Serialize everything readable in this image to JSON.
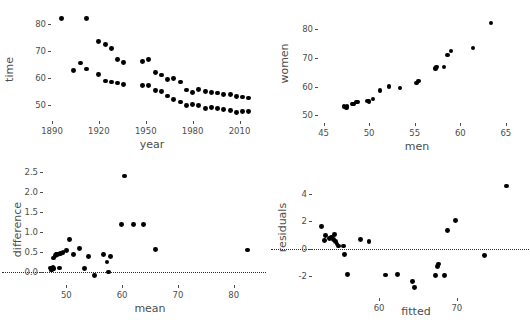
{
  "figure": {
    "background": "#ffffff",
    "point_color": "#000000",
    "text_color": "#4d4d4d",
    "reference_line_color": "#2b2b2b",
    "layout": "2x2 grid of scatter plots"
  },
  "chart_data": [
    {
      "id": "time-vs-year",
      "position": "top-left",
      "type": "scatter",
      "title": "",
      "xlabel": "year",
      "ylabel": "time",
      "xlim": [
        1890,
        2018
      ],
      "ylim": [
        46,
        86
      ],
      "xticks": [
        1890,
        1920,
        1950,
        1980,
        2010
      ],
      "yticks": [
        50,
        60,
        70,
        80
      ],
      "grid": false,
      "legend": "none",
      "series": [
        {
          "name": "women",
          "points": [
            [
              1912,
              82.2
            ],
            [
              1920,
              73.6
            ],
            [
              1924,
              72.4
            ],
            [
              1928,
              71.0
            ],
            [
              1932,
              66.8
            ],
            [
              1936,
              65.9
            ],
            [
              1948,
              66.3
            ],
            [
              1952,
              66.8
            ],
            [
              1956,
              62.0
            ],
            [
              1960,
              61.2
            ],
            [
              1964,
              59.5
            ],
            [
              1968,
              60.0
            ],
            [
              1972,
              58.59
            ],
            [
              1976,
              55.65
            ],
            [
              1980,
              54.79
            ],
            [
              1984,
              55.92
            ],
            [
              1988,
              54.93
            ],
            [
              1992,
              54.64
            ],
            [
              1996,
              54.5
            ],
            [
              2000,
              53.83
            ],
            [
              2004,
              53.84
            ],
            [
              2008,
              53.12
            ],
            [
              2012,
              53.0
            ],
            [
              2016,
              52.7
            ]
          ]
        },
        {
          "name": "men",
          "points": [
            [
              1896,
              82.2
            ],
            [
              1904,
              62.8
            ],
            [
              1908,
              65.6
            ],
            [
              1912,
              63.4
            ],
            [
              1920,
              61.4
            ],
            [
              1924,
              59.0
            ],
            [
              1928,
              58.6
            ],
            [
              1932,
              58.2
            ],
            [
              1936,
              57.6
            ],
            [
              1948,
              57.3
            ],
            [
              1952,
              57.4
            ],
            [
              1956,
              55.4
            ],
            [
              1960,
              55.2
            ],
            [
              1964,
              53.4
            ],
            [
              1968,
              52.2
            ],
            [
              1972,
              51.22
            ],
            [
              1976,
              49.99
            ],
            [
              1980,
              50.4
            ],
            [
              1984,
              49.8
            ],
            [
              1988,
              48.63
            ],
            [
              1992,
              49.02
            ],
            [
              1996,
              48.74
            ],
            [
              2000,
              48.3
            ],
            [
              2004,
              48.17
            ],
            [
              2008,
              47.21
            ],
            [
              2012,
              47.52
            ],
            [
              2016,
              47.58
            ]
          ]
        }
      ]
    },
    {
      "id": "women-vs-men",
      "position": "top-right",
      "type": "scatter",
      "title": "",
      "xlabel": "men",
      "ylabel": "women",
      "xlim": [
        44.5,
        66
      ],
      "ylim": [
        49,
        84
      ],
      "xticks": [
        45,
        50,
        55,
        60,
        65
      ],
      "yticks": [
        50,
        60,
        70,
        80
      ],
      "grid": false,
      "legend": "none",
      "points": [
        [
          47.21,
          53.0
        ],
        [
          47.52,
          52.7
        ],
        [
          47.58,
          53.12
        ],
        [
          48.17,
          53.83
        ],
        [
          48.3,
          53.84
        ],
        [
          48.63,
          54.5
        ],
        [
          48.74,
          54.64
        ],
        [
          49.8,
          54.93
        ],
        [
          49.99,
          54.79
        ],
        [
          50.4,
          55.65
        ],
        [
          51.22,
          58.59
        ],
        [
          52.2,
          60.0
        ],
        [
          53.4,
          59.5
        ],
        [
          55.2,
          61.2
        ],
        [
          55.4,
          62.0
        ],
        [
          57.3,
          66.3
        ],
        [
          57.4,
          66.8
        ],
        [
          58.2,
          66.8
        ],
        [
          58.6,
          71.0
        ],
        [
          59.0,
          72.4
        ],
        [
          61.4,
          73.6
        ],
        [
          63.4,
          82.2
        ]
      ]
    },
    {
      "id": "difference-vs-mean",
      "position": "bottom-left",
      "type": "scatter",
      "title": "",
      "xlabel": "mean",
      "ylabel": "difference",
      "xlim": [
        46,
        84
      ],
      "ylim": [
        -0.2,
        2.6
      ],
      "xticks": [
        50,
        60,
        70,
        80
      ],
      "yticks": [
        0.0,
        0.5,
        1.0,
        1.5,
        2.0,
        2.5
      ],
      "grid": false,
      "legend": "none",
      "reference_line": {
        "type": "horizontal",
        "y": 0.0,
        "style": "dotted"
      },
      "points": [
        [
          47.1,
          0.1
        ],
        [
          47.3,
          0.06
        ],
        [
          47.4,
          0.05
        ],
        [
          47.5,
          0.08
        ],
        [
          47.6,
          0.12
        ],
        [
          47.7,
          0.35
        ],
        [
          47.8,
          0.09
        ],
        [
          48.0,
          0.42
        ],
        [
          48.2,
          0.45
        ],
        [
          48.4,
          0.44
        ],
        [
          48.6,
          0.45
        ],
        [
          48.8,
          0.1
        ],
        [
          49.0,
          0.46
        ],
        [
          49.4,
          0.49
        ],
        [
          50.0,
          0.53
        ],
        [
          50.6,
          0.82
        ],
        [
          51.3,
          0.44
        ],
        [
          52.3,
          0.58
        ],
        [
          53.2,
          0.08
        ],
        [
          54.0,
          0.38
        ],
        [
          55.0,
          -0.08
        ],
        [
          56.6,
          0.43
        ],
        [
          57.3,
          0.25
        ],
        [
          57.6,
          0.0
        ],
        [
          57.9,
          0.38
        ],
        [
          59.9,
          1.19
        ],
        [
          60.4,
          2.4
        ],
        [
          62.1,
          1.19
        ],
        [
          63.9,
          1.19
        ],
        [
          66.0,
          0.57
        ],
        [
          82.5,
          0.55
        ]
      ]
    },
    {
      "id": "residuals-vs-fitted",
      "position": "bottom-right",
      "type": "scatter",
      "title": "",
      "xlabel": "fitted",
      "ylabel": "residuals",
      "xlim": [
        51.5,
        78
      ],
      "ylim": [
        -3.2,
        5.2
      ],
      "xticks": [
        60,
        70
      ],
      "yticks": [
        -2,
        0,
        2,
        4
      ],
      "grid": false,
      "legend": "none",
      "reference_line": {
        "type": "horizontal",
        "y": 0.0,
        "style": "dotted"
      },
      "points": [
        [
          52.6,
          1.6
        ],
        [
          53.0,
          0.6
        ],
        [
          53.1,
          0.95
        ],
        [
          53.6,
          0.75
        ],
        [
          53.9,
          0.85
        ],
        [
          54.1,
          0.65
        ],
        [
          54.3,
          1.05
        ],
        [
          54.4,
          0.55
        ],
        [
          54.6,
          0.35
        ],
        [
          54.8,
          0.2
        ],
        [
          55.4,
          0.2
        ],
        [
          55.6,
          -0.4
        ],
        [
          55.9,
          -1.85
        ],
        [
          57.6,
          0.65
        ],
        [
          58.7,
          0.55
        ],
        [
          60.8,
          -1.9
        ],
        [
          62.4,
          -1.85
        ],
        [
          64.3,
          -2.35
        ],
        [
          64.6,
          -2.8
        ],
        [
          67.3,
          -1.95
        ],
        [
          67.5,
          -1.3
        ],
        [
          67.6,
          -1.1
        ],
        [
          68.4,
          -1.95
        ],
        [
          68.8,
          1.35
        ],
        [
          69.8,
          2.05
        ],
        [
          73.6,
          -0.5
        ],
        [
          76.4,
          4.55
        ]
      ]
    }
  ]
}
